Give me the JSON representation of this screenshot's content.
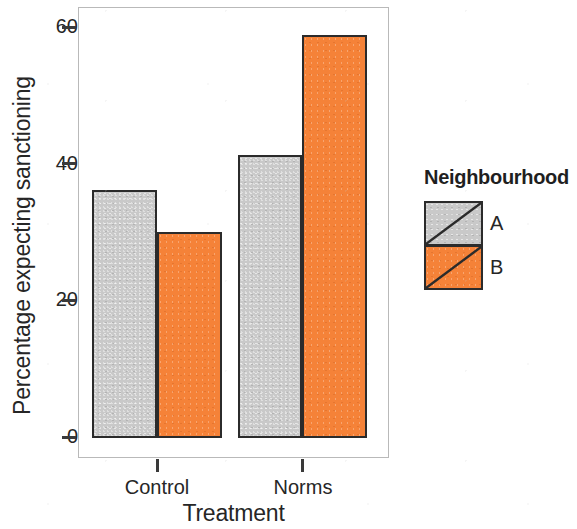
{
  "chart_data": {
    "type": "bar",
    "title": "",
    "xlabel": "Treatment",
    "ylabel": "Percentage expecting sanctioning",
    "categories": [
      "Control",
      "Norms"
    ],
    "series": [
      {
        "name": "A",
        "color": "#c9c9c9",
        "values": [
          36.4,
          41.4
        ]
      },
      {
        "name": "B",
        "color": "#f58238",
        "values": [
          30.2,
          59.0
        ]
      }
    ],
    "ylim": [
      0,
      63
    ],
    "yticks": [
      0,
      20,
      40,
      60
    ],
    "ytick_labels": [
      "0",
      "20",
      "40",
      "60"
    ],
    "grid": false,
    "legend": {
      "title": "Neighbourhood",
      "position": "right",
      "entries": [
        {
          "label": "A",
          "color": "#c9c9c9"
        },
        {
          "label": "B",
          "color": "#f58238"
        }
      ]
    }
  },
  "axis": {
    "y_title": "Percentage expecting sanctioning",
    "x_title": "Treatment",
    "y_tick_0": "0",
    "y_tick_1": "20",
    "y_tick_2": "40",
    "y_tick_3": "60",
    "x_tick_0": "Control",
    "x_tick_1": "Norms"
  },
  "legend": {
    "title": "Neighbourhood",
    "label_a": "A",
    "label_b": "B"
  },
  "colors": {
    "series_a": "#c9c9c9",
    "series_b": "#f58238",
    "bar_outline": "#2b2b2b",
    "panel_border": "#b9b9b9",
    "text": "#262626"
  }
}
